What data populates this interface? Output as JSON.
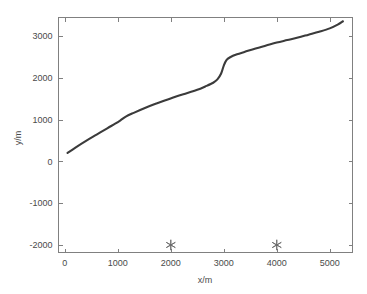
{
  "chart_data": {
    "type": "line",
    "title": "",
    "xlabel": "x/m",
    "ylabel": "y/m",
    "xlim": [
      -120,
      5430
    ],
    "ylim": [
      -2180,
      3440
    ],
    "grid": false,
    "legend": null,
    "xticks": [
      0,
      1000,
      2000,
      3000,
      4000,
      5000
    ],
    "xticklabels": [
      "0",
      "1000",
      "2000",
      "3000",
      "4000",
      "5000"
    ],
    "yticks": [
      -2000,
      -1000,
      0,
      1000,
      2000,
      3000
    ],
    "yticklabels": [
      "-2000",
      "-1000",
      "0",
      "1000",
      "2000",
      "3000"
    ],
    "series": [
      {
        "name": "trajectory",
        "style": "solid-line",
        "color": "#3b3b3b",
        "x": [
          50,
          200,
          400,
          600,
          800,
          950,
          1050,
          1150,
          1300,
          1500,
          1700,
          1900,
          2100,
          2300,
          2500,
          2650,
          2800,
          2880,
          2950,
          3000,
          3050,
          3120,
          3250,
          3400,
          3600,
          3800,
          4000,
          4200,
          4400,
          4600,
          4800,
          5000,
          5150,
          5250
        ],
        "y": [
          200,
          330,
          490,
          640,
          790,
          900,
          980,
          1070,
          1160,
          1270,
          1370,
          1460,
          1550,
          1630,
          1710,
          1790,
          1880,
          1960,
          2100,
          2290,
          2420,
          2490,
          2560,
          2620,
          2700,
          2770,
          2840,
          2900,
          2960,
          3030,
          3100,
          3180,
          3270,
          3350
        ]
      },
      {
        "name": "station-markers",
        "style": "asterisk-markers",
        "color": "#6a6a6a",
        "x": [
          2000,
          4000
        ],
        "y": [
          -2000,
          -2000
        ]
      }
    ]
  },
  "figure": {
    "background_color": "#ffffff",
    "axis_color": "#808080",
    "curve_color": "#3b3b3b",
    "marker_color": "#6a6a6a",
    "text_color": "#4a4a4a"
  }
}
